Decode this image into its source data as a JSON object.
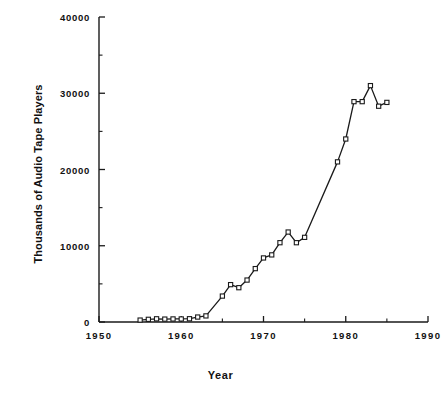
{
  "chart_data": {
    "type": "line",
    "title": "",
    "subtitle": "",
    "xlabel": "Year",
    "ylabel": "Thousands of Audio Tape Players",
    "xlim": [
      1950,
      1990
    ],
    "ylim": [
      0,
      40000
    ],
    "xticks": [
      1950,
      1960,
      1970,
      1980,
      1990
    ],
    "xticklabels": [
      "1950",
      "1960",
      "1970",
      "1980",
      "1990"
    ],
    "xminorticks": [
      1955,
      1965,
      1975,
      1985
    ],
    "yticks": [
      0,
      10000,
      20000,
      30000,
      40000
    ],
    "yticklabels": [
      "0",
      "10000",
      "20000",
      "30000",
      "40000"
    ],
    "yminorticks": [
      5000,
      15000,
      25000,
      35000
    ],
    "grid": false,
    "legend": false,
    "marker": "square-open",
    "line_color": "#1a1a1a",
    "marker_face_color": "#ffffff",
    "marker_edge_color": "#1a1a1a",
    "x": [
      1955,
      1956,
      1957,
      1958,
      1959,
      1960,
      1961,
      1962,
      1963,
      1965,
      1966,
      1967,
      1968,
      1969,
      1970,
      1971,
      1972,
      1973,
      1974,
      1975,
      1979,
      1980,
      1981,
      1982,
      1983,
      1984,
      1985
    ],
    "values": [
      250,
      350,
      420,
      380,
      400,
      400,
      430,
      650,
      800,
      3400,
      4900,
      4500,
      5500,
      7000,
      8400,
      8800,
      10400,
      11800,
      10400,
      11100,
      21000,
      24000,
      28900,
      28900,
      31000,
      28300,
      28800
    ],
    "series": [
      {
        "name": "Audio Tape Players",
        "x": [
          1955,
          1956,
          1957,
          1958,
          1959,
          1960,
          1961,
          1962,
          1963,
          1965,
          1966,
          1967,
          1968,
          1969,
          1970,
          1971,
          1972,
          1973,
          1974,
          1975,
          1979,
          1980,
          1981,
          1982,
          1983,
          1984,
          1985
        ],
        "values": [
          250,
          350,
          420,
          380,
          400,
          400,
          430,
          650,
          800,
          3400,
          4900,
          4500,
          5500,
          7000,
          8400,
          8800,
          10400,
          11800,
          10400,
          11100,
          21000,
          24000,
          28900,
          28900,
          31000,
          28300,
          28800
        ]
      }
    ]
  },
  "axes": {
    "x_title": "Year",
    "y_title": "Thousands of Audio Tape Players"
  }
}
